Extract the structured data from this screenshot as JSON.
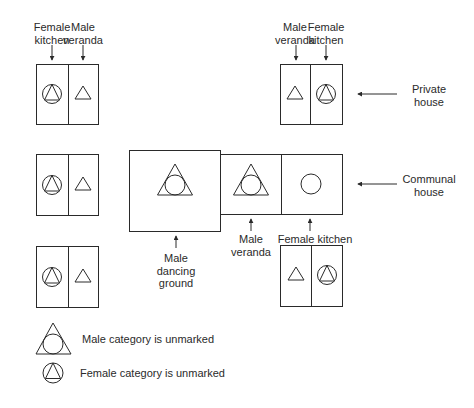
{
  "labels": {
    "top_left_kitchen": [
      "Female",
      "kitchen"
    ],
    "top_left_veranda": [
      "Male",
      "veranda"
    ],
    "top_right_veranda": [
      "Male",
      "veranda"
    ],
    "top_right_kitchen": [
      "Female",
      "kitchen"
    ],
    "private_house": [
      "Private",
      "house"
    ],
    "communal_house": [
      "Communal",
      "house"
    ],
    "dancing_ground": [
      "Male",
      "dancing",
      "ground"
    ],
    "communal_veranda": [
      "Male",
      "veranda"
    ],
    "communal_kitchen": "Female kitchen"
  },
  "legend": {
    "male_unmarked": "Male category is unmarked",
    "female_unmarked": "Female category is unmarked"
  },
  "colors": {
    "line": "#2a2a2a",
    "background": "#ffffff"
  }
}
